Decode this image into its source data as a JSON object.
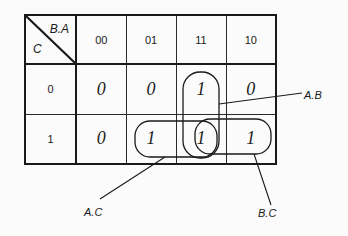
{
  "kmap": {
    "corner": {
      "column_variables": "B.A",
      "row_variable": "C"
    },
    "column_headers": [
      "00",
      "01",
      "11",
      "10"
    ],
    "rows": [
      {
        "label": "0",
        "cells": [
          "0",
          "0",
          "1",
          "0"
        ]
      },
      {
        "label": "1",
        "cells": [
          "0",
          "1",
          "1",
          "1"
        ]
      }
    ]
  },
  "groups": [
    {
      "term": "A.B",
      "cells": "column 11, rows 0–1"
    },
    {
      "term": "A.C",
      "cells": "row 1, columns 01–11"
    },
    {
      "term": "B.C",
      "cells": "row 1, columns 11–10"
    }
  ],
  "labels": {
    "ab": "A.B",
    "ac": "A.C",
    "bc": "B.C"
  }
}
